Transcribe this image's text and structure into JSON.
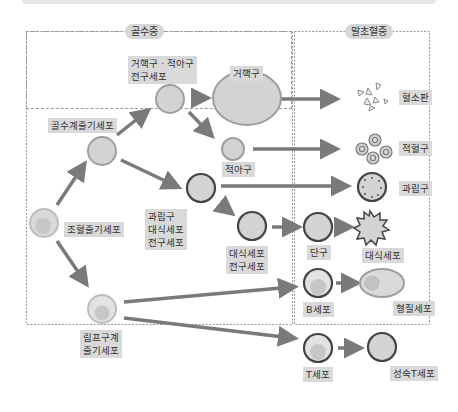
{
  "panels": {
    "bone_marrow": {
      "title": "골수중"
    },
    "peripheral_blood": {
      "title": "말초혈중"
    }
  },
  "cells": {
    "hematopoietic_stem_cell": "조혈줄기세포",
    "myeloid_stem_cell": "골수계줄기세포",
    "mega_erythro_progenitor": "거핵구 · 적아구\n전구세포",
    "megakaryocyte": "거핵구",
    "erythroblast": "적아구",
    "granulocyte_macrophage_progenitor": "과립구\n대식세포\n전구세포",
    "macrophage_progenitor": "대식세포\n전구세포",
    "lymphoid_stem_cell": "림프구계\n줄기세포",
    "platelet": "혈소판",
    "erythrocyte": "적혈구",
    "granulocyte": "과립구",
    "monocyte": "단구",
    "macrophage": "대식세포",
    "b_cell": "B세포",
    "plasma_cell": "형질세포",
    "t_cell": "T세포",
    "mature_t_cell": "성숙T세포"
  },
  "colors": {
    "cell_fill": "#d3d3d3",
    "cell_border": "#9a9a9a",
    "dark_border": "#444444",
    "arrow": "#7a7a7a",
    "label_bg": "#d9d9d9"
  }
}
